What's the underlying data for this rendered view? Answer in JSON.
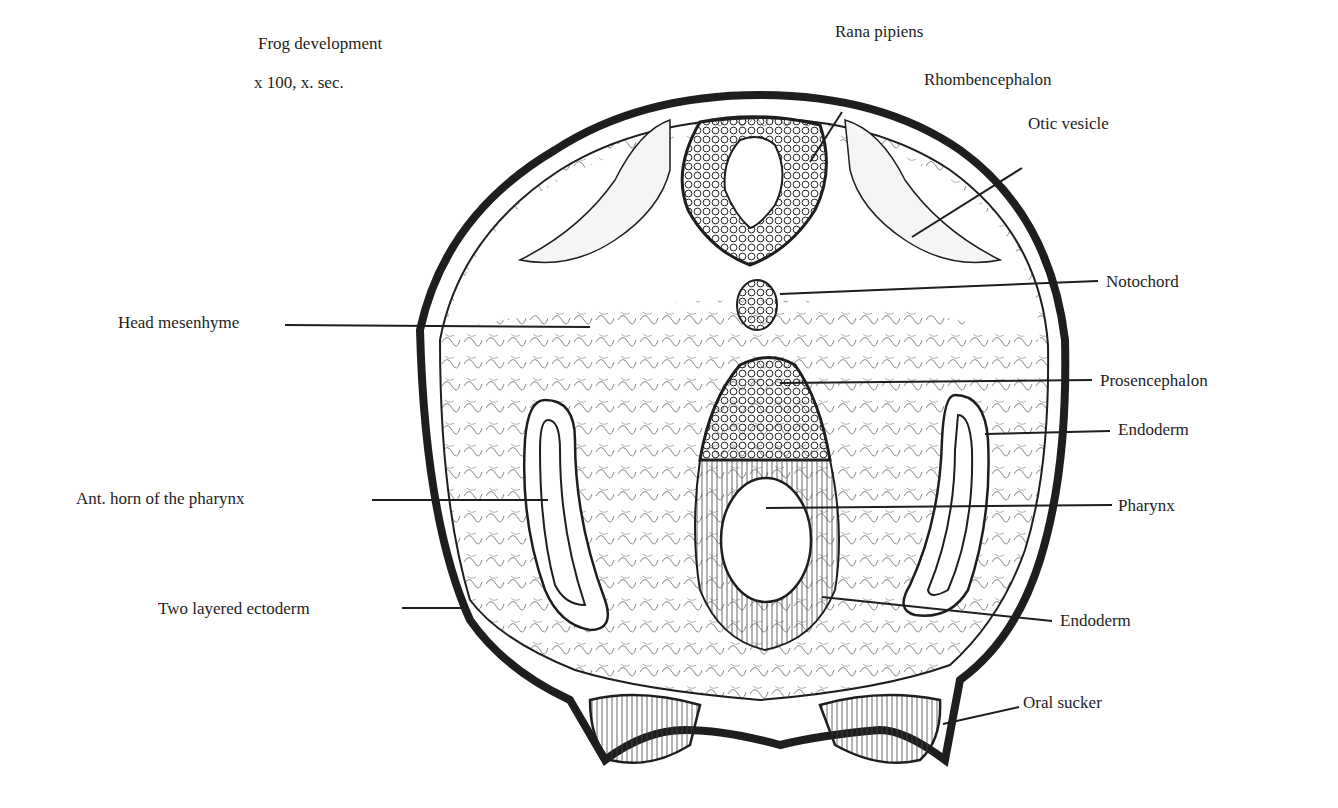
{
  "header": {
    "title": "Frog development",
    "magnification": "x 100, x. sec.",
    "species": "Rana pipiens"
  },
  "labels": {
    "rhombencephalon": "Rhombencephalon",
    "otic_vesicle": "Otic vesicle",
    "notochord": "Notochord",
    "head_mesenhyme": "Head mesenhyme",
    "prosencephalon": "Prosencephalon",
    "endoderm_upper": "Endoderm",
    "ant_horn": "Ant. horn of the pharynx",
    "pharynx": "Pharynx",
    "two_layered_ectoderm": "Two layered ectoderm",
    "endoderm_lower": "Endoderm",
    "oral_sucker": "Oral sucker"
  },
  "colors": {
    "ink": "#1e1e1e",
    "paper": "#ffffff"
  }
}
